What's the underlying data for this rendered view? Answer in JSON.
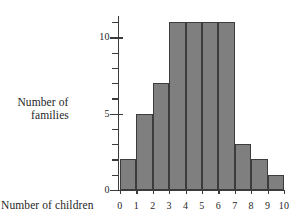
{
  "chart_data": {
    "type": "bar",
    "title": "",
    "subtitle": "",
    "xlabel": "Number of children",
    "ylabel_lines": [
      "Number of",
      "families"
    ],
    "ylabel": "Number of families",
    "categories": [
      "0-1",
      "1-2",
      "2-3",
      "3-4",
      "4-5",
      "5-6",
      "6-7",
      "7-8",
      "8-9",
      "9-10"
    ],
    "values": [
      2,
      5,
      7,
      11,
      11,
      11,
      11,
      3,
      2,
      1
    ],
    "bin_edges": [
      "0",
      "1",
      "2",
      "3",
      "4",
      "5",
      "6",
      "7",
      "8",
      "9",
      "10"
    ],
    "xtick_labels": [
      "0",
      "1",
      "2",
      "3",
      "4",
      "5",
      "6",
      "7",
      "8",
      "9",
      "10"
    ],
    "ytick_labels": [
      "0",
      "5",
      "10"
    ],
    "ytick_values": [
      0,
      5,
      10
    ],
    "yminor_values": [
      1,
      2,
      3,
      4,
      6,
      7,
      8,
      9,
      11
    ],
    "ylim": [
      0,
      11.4
    ],
    "xlim": [
      0,
      10
    ],
    "grid": false,
    "legend": false,
    "bar_color": "#807f7f",
    "bar_edge_color": "#3c3c3c",
    "axis_color": "#3a3a3a",
    "background": "#ffffff"
  }
}
